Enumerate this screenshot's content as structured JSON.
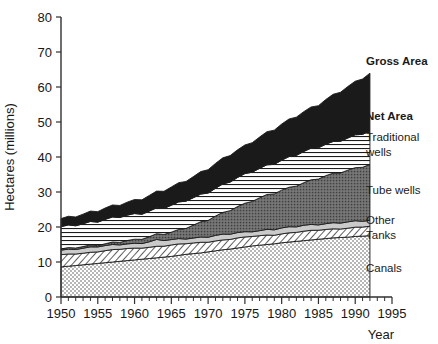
{
  "chart_data": {
    "type": "area",
    "title": "",
    "subtitle": "",
    "xlabel": "Year",
    "ylabel": "Hectares (millions)",
    "xlim": [
      1950,
      1995
    ],
    "ylim": [
      0,
      80
    ],
    "grid": false,
    "legend_position": "right-inline-labels",
    "stacked": true,
    "x_major_ticks": [
      1950,
      1955,
      1960,
      1965,
      1970,
      1975,
      1980,
      1985,
      1990,
      1995
    ],
    "x_minor_tick_step": 1,
    "y_ticks": [
      0,
      10,
      20,
      30,
      40,
      50,
      60,
      70,
      80
    ],
    "x": [
      1950,
      1951,
      1952,
      1953,
      1954,
      1955,
      1956,
      1957,
      1958,
      1959,
      1960,
      1961,
      1962,
      1963,
      1964,
      1965,
      1966,
      1967,
      1968,
      1969,
      1970,
      1971,
      1972,
      1973,
      1974,
      1975,
      1976,
      1977,
      1978,
      1979,
      1980,
      1981,
      1982,
      1983,
      1984,
      1985,
      1986,
      1987,
      1988,
      1989,
      1990,
      1991,
      1992
    ],
    "series": [
      {
        "name": "Canals",
        "label": "Canals",
        "fill": "fine-dots",
        "values": [
          8.6,
          8.8,
          9.0,
          9.2,
          9.4,
          9.6,
          9.8,
          10.0,
          10.2,
          10.4,
          10.6,
          10.8,
          11.0,
          11.2,
          11.4,
          11.6,
          11.9,
          12.2,
          12.4,
          12.6,
          12.9,
          13.2,
          13.5,
          13.7,
          14.0,
          14.3,
          14.6,
          14.8,
          15.0,
          15.2,
          15.5,
          15.7,
          15.9,
          16.1,
          16.3,
          16.5,
          16.7,
          16.9,
          17.0,
          17.1,
          17.3,
          17.4,
          17.5
        ]
      },
      {
        "name": "Tanks",
        "label": "Tanks",
        "fill": "diagonal-hatch",
        "values": [
          3.4,
          3.4,
          3.4,
          3.4,
          3.4,
          3.4,
          3.4,
          3.4,
          3.4,
          3.4,
          3.3,
          3.3,
          3.3,
          3.3,
          3.2,
          3.2,
          3.1,
          3.0,
          3.0,
          3.0,
          2.9,
          2.9,
          2.8,
          2.8,
          2.8,
          2.7,
          2.7,
          2.7,
          2.7,
          2.6,
          2.6,
          2.6,
          2.6,
          2.6,
          2.6,
          2.6,
          2.6,
          2.6,
          2.6,
          2.6,
          2.6,
          2.6,
          2.6
        ]
      },
      {
        "name": "Other",
        "label": "Other",
        "fill": "light-gray",
        "values": [
          1.4,
          1.4,
          1.4,
          1.4,
          1.4,
          1.4,
          1.4,
          1.4,
          1.4,
          1.4,
          1.4,
          1.4,
          1.5,
          1.8,
          1.6,
          1.5,
          1.5,
          1.5,
          1.5,
          1.5,
          1.5,
          1.5,
          1.5,
          1.5,
          1.5,
          1.5,
          1.5,
          1.5,
          1.6,
          1.6,
          1.6,
          1.6,
          1.6,
          1.7,
          1.7,
          1.7,
          1.7,
          1.7,
          1.7,
          1.7,
          1.7,
          1.7,
          1.7
        ]
      },
      {
        "name": "Tube wells",
        "label": "Tube wells",
        "fill": "dark-gray-stipple",
        "values": [
          0.3,
          0.3,
          0.4,
          0.4,
          0.5,
          0.5,
          0.6,
          0.7,
          0.8,
          0.9,
          1.0,
          1.2,
          1.4,
          1.6,
          1.9,
          2.2,
          2.6,
          3.1,
          3.6,
          4.2,
          4.8,
          5.5,
          6.2,
          6.9,
          7.5,
          8.1,
          8.7,
          9.3,
          9.8,
          10.3,
          10.8,
          11.3,
          11.8,
          12.2,
          12.7,
          13.1,
          13.6,
          14.0,
          14.4,
          14.8,
          15.2,
          15.6,
          16.0
        ]
      },
      {
        "name": "Traditional wells",
        "label": "Traditional wells",
        "fill": "horizontal-lines",
        "values": [
          6.3,
          6.4,
          6.5,
          6.6,
          6.7,
          6.8,
          6.9,
          7.0,
          7.1,
          7.2,
          7.3,
          7.3,
          7.4,
          7.4,
          7.5,
          7.6,
          7.7,
          7.8,
          7.8,
          7.9,
          8.0,
          8.0,
          8.1,
          8.2,
          8.2,
          8.3,
          8.4,
          8.4,
          8.5,
          8.6,
          8.6,
          8.7,
          8.8,
          8.8,
          8.9,
          9.0,
          9.0,
          9.1,
          9.2,
          9.2,
          9.3,
          9.4,
          9.4
        ]
      },
      {
        "name": "Gross Area above Net Area",
        "label": "Gross Area",
        "fill": "black",
        "values": [
          2.4,
          2.5,
          2.6,
          2.7,
          2.8,
          3.0,
          3.2,
          3.4,
          3.6,
          3.8,
          4.0,
          4.2,
          4.4,
          4.6,
          4.9,
          5.2,
          5.5,
          5.8,
          6.1,
          6.4,
          6.7,
          7.0,
          7.3,
          7.6,
          7.9,
          8.2,
          8.6,
          9.0,
          9.4,
          9.8,
          10.2,
          10.6,
          11.0,
          11.4,
          11.8,
          12.2,
          12.8,
          13.4,
          14.0,
          14.6,
          15.2,
          15.9,
          16.6
        ]
      }
    ],
    "cumulative_totals": {
      "net_area_1950": 20.0,
      "net_area_1992": 47.2,
      "gross_area_1950": 22.4,
      "gross_area_1992": 63.8
    },
    "annotations": [
      {
        "name": "gross-area",
        "text": "Gross Area",
        "bold": true
      },
      {
        "name": "net-area",
        "text": "Net Area",
        "bold": true
      },
      {
        "name": "traditional-wells",
        "text": "Traditional",
        "text2": "wells",
        "bold": false
      },
      {
        "name": "tube-wells",
        "text": "Tube wells",
        "bold": false
      },
      {
        "name": "other",
        "text": "Other",
        "bold": false
      },
      {
        "name": "tanks",
        "text": "Tanks",
        "bold": false
      },
      {
        "name": "canals",
        "text": "Canals",
        "bold": false
      }
    ],
    "colors": {
      "black": "#1a1a1a",
      "dark_gray": "#6e6e6e",
      "light_gray": "#c8c8c8",
      "white": "#ffffff",
      "axis": "#303030"
    }
  },
  "labels": {
    "y_axis_title": "Hectares (millions)",
    "x_axis_title": "Year",
    "gross_area": "Gross Area",
    "net_area": "Net Area",
    "traditional_wells_1": "Traditional",
    "traditional_wells_2": "wells",
    "tube_wells": "Tube wells",
    "other": "Other",
    "tanks": "Tanks",
    "canals": "Canals",
    "y_0": "0",
    "y_10": "10",
    "y_20": "20",
    "y_30": "30",
    "y_40": "40",
    "y_50": "50",
    "y_60": "60",
    "y_70": "70",
    "y_80": "80",
    "x_1950": "1950",
    "x_1955": "1955",
    "x_1960": "1960",
    "x_1965": "1965",
    "x_1970": "1970",
    "x_1975": "1975",
    "x_1980": "1980",
    "x_1985": "1985",
    "x_1990": "1990",
    "x_1995": "1995"
  }
}
